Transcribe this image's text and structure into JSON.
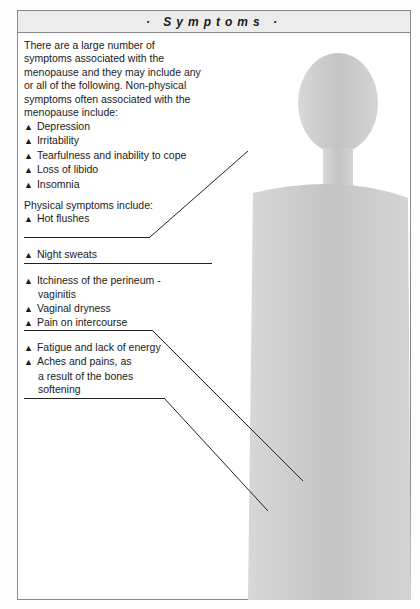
{
  "header": {
    "title": "· Symptoms ·"
  },
  "intro": "There are a large number of symptoms associated with the menopause and they may include any or all of the following. Non-physical symptoms often associated with the menopause include:",
  "non_physical": [
    "Depression",
    "Irritability",
    "Tearfulness and inability to cope",
    "Loss of libido",
    "Insomnia"
  ],
  "physical_heading": "Physical symptoms include:",
  "groups": [
    {
      "items": [
        "Hot flushes"
      ]
    },
    {
      "items": [
        "Night sweats"
      ]
    },
    {
      "items": [
        "Itchiness of the perineum -",
        "Vaginal dryness",
        "Pain on intercourse"
      ],
      "continuation": "vaginitis"
    },
    {
      "items": [
        "Fatigue and lack of energy",
        "Aches and pains, as"
      ],
      "continuation": [
        "a result of the bones",
        "softening"
      ]
    }
  ]
}
